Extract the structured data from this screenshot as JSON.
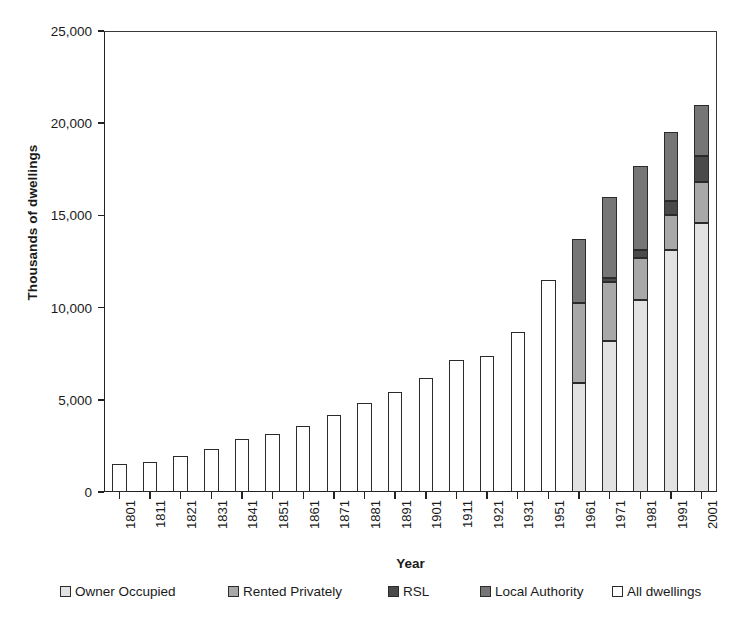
{
  "chart_data": {
    "type": "bar",
    "subtype": "stacked-bar",
    "title": "",
    "xlabel": "Year",
    "ylabel": "Thousands of dwellings",
    "ylim": [
      0,
      25000
    ],
    "yticks": [
      0,
      5000,
      10000,
      15000,
      20000,
      25000
    ],
    "ytick_labels": [
      "0",
      "5,000",
      "10,000",
      "15,000",
      "20,000",
      "25,000"
    ],
    "grid": false,
    "legend_position": "bottom",
    "categories": [
      "1801",
      "1811",
      "1821",
      "1831",
      "1841",
      "1851",
      "1861",
      "1871",
      "1881",
      "1891",
      "1901",
      "1911",
      "1921",
      "1931",
      "1951",
      "1961",
      "1971",
      "1981",
      "1991",
      "2001"
    ],
    "series": [
      {
        "name": "Owner Occupied",
        "color": "#e2e2e2",
        "values": [
          null,
          null,
          null,
          null,
          null,
          null,
          null,
          null,
          null,
          null,
          null,
          null,
          null,
          null,
          null,
          5900,
          8200,
          10400,
          13100,
          14600
        ]
      },
      {
        "name": "Rented Privately",
        "color": "#a8a8a8",
        "values": [
          null,
          null,
          null,
          null,
          null,
          null,
          null,
          null,
          null,
          null,
          null,
          null,
          null,
          null,
          null,
          4350,
          3200,
          2300,
          1900,
          2200
        ]
      },
      {
        "name": "RSL",
        "color": "#4a4a4a",
        "values": [
          null,
          null,
          null,
          null,
          null,
          null,
          null,
          null,
          null,
          null,
          null,
          null,
          null,
          null,
          null,
          0,
          200,
          450,
          800,
          1400
        ]
      },
      {
        "name": "Local Authority",
        "color": "#767676",
        "values": [
          null,
          null,
          null,
          null,
          null,
          null,
          null,
          null,
          null,
          null,
          null,
          null,
          null,
          null,
          null,
          3450,
          4400,
          4550,
          3700,
          2800
        ]
      },
      {
        "name": "All dwellings",
        "color": "#ffffff",
        "values": [
          1500,
          1650,
          1950,
          2350,
          2850,
          3150,
          3600,
          4150,
          4850,
          5400,
          6200,
          7150,
          7400,
          8700,
          11500,
          null,
          null,
          null,
          null,
          null
        ]
      }
    ],
    "totals": [
      1500,
      1650,
      1950,
      2350,
      2850,
      3150,
      3600,
      4150,
      4850,
      5400,
      6200,
      7150,
      7400,
      8700,
      11500,
      13700,
      16000,
      17700,
      19500,
      21000
    ]
  },
  "legend": {
    "items": [
      {
        "label": "Owner Occupied",
        "color": "#e2e2e2"
      },
      {
        "label": "Rented Privately",
        "color": "#a8a8a8"
      },
      {
        "label": "RSL",
        "color": "#4a4a4a"
      },
      {
        "label": "Local Authority",
        "color": "#767676"
      },
      {
        "label": "All dwellings",
        "color": "#ffffff"
      }
    ]
  }
}
